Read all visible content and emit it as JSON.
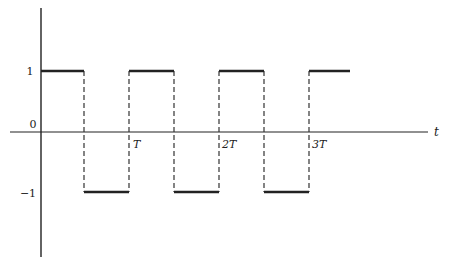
{
  "diagram": {
    "type": "square-wave",
    "axes": {
      "x_label": "t",
      "y_ticks": [
        {
          "label": "1",
          "value": 1
        },
        {
          "label": "0",
          "value": 0
        },
        {
          "label": "−1",
          "value": -1
        }
      ],
      "x_ticks": [
        {
          "label": "T",
          "value": 1
        },
        {
          "label": "2T",
          "value": 2
        },
        {
          "label": "3T",
          "value": 3
        }
      ]
    },
    "signal": {
      "high": 1,
      "low": -1,
      "period_label": "T",
      "segments": [
        {
          "from": 0,
          "to": 0.5,
          "level": 1
        },
        {
          "from": 0.5,
          "to": 1,
          "level": -1
        },
        {
          "from": 1,
          "to": 1.5,
          "level": 1
        },
        {
          "from": 1.5,
          "to": 2,
          "level": -1
        },
        {
          "from": 2,
          "to": 2.5,
          "level": 1
        },
        {
          "from": 2.5,
          "to": 3,
          "level": -1
        },
        {
          "from": 3,
          "to": 3.45,
          "level": 1
        }
      ],
      "transition_style": "dashed"
    },
    "colors": {
      "line": "#222222",
      "background": "#ffffff"
    }
  }
}
